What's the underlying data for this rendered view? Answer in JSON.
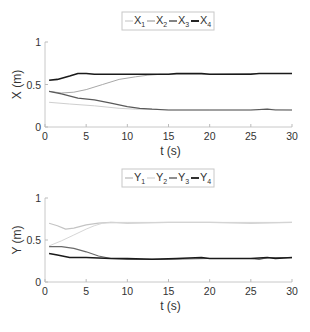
{
  "chart_data": [
    {
      "type": "line",
      "title": "",
      "xlabel": "t (s)",
      "ylabel": "X (m)",
      "xlim": [
        0,
        30
      ],
      "ylim": [
        0,
        1
      ],
      "xticks": [
        0,
        5,
        10,
        15,
        20,
        25,
        30
      ],
      "yticks": [
        0,
        0.5,
        1
      ],
      "xtick_labels": [
        "0",
        "5",
        "10",
        "15",
        "20",
        "25",
        "30"
      ],
      "ytick_labels": [
        "0",
        "0.5",
        "1"
      ],
      "grid": false,
      "legend_position": "top-center-outside",
      "legend": [
        {
          "base": "X",
          "sub": "1"
        },
        {
          "base": "X",
          "sub": "2"
        },
        {
          "base": "X",
          "sub": "3"
        },
        {
          "base": "X",
          "sub": "4"
        }
      ],
      "series": [
        {
          "name": "X1",
          "color": "#cfcfcf",
          "width": 1,
          "x": [
            0.5,
            3,
            6,
            9,
            11,
            13,
            15,
            20,
            25,
            27,
            30
          ],
          "y": [
            0.29,
            0.27,
            0.25,
            0.22,
            0.21,
            0.21,
            0.2,
            0.2,
            0.2,
            0.21,
            0.2
          ]
        },
        {
          "name": "X2",
          "color": "#a8a8a8",
          "width": 1,
          "x": [
            0.5,
            2,
            3.5,
            5,
            7,
            9,
            11,
            12.5,
            14,
            20,
            25,
            30
          ],
          "y": [
            0.42,
            0.4,
            0.41,
            0.44,
            0.5,
            0.56,
            0.59,
            0.61,
            0.62,
            0.62,
            0.63,
            0.63
          ]
        },
        {
          "name": "X3",
          "color": "#5a5a5a",
          "width": 1.2,
          "x": [
            0.5,
            2,
            4,
            6,
            8,
            10,
            11.5,
            13,
            15,
            20,
            25,
            27,
            28,
            30
          ],
          "y": [
            0.42,
            0.39,
            0.34,
            0.32,
            0.28,
            0.24,
            0.22,
            0.21,
            0.2,
            0.2,
            0.2,
            0.21,
            0.2,
            0.2
          ]
        },
        {
          "name": "X4",
          "color": "#1a1a1a",
          "width": 1.6,
          "x": [
            0.5,
            1.5,
            3,
            4,
            5,
            6,
            10,
            15,
            16,
            19,
            20,
            25,
            26,
            30
          ],
          "y": [
            0.55,
            0.56,
            0.6,
            0.63,
            0.63,
            0.62,
            0.62,
            0.62,
            0.63,
            0.63,
            0.62,
            0.62,
            0.63,
            0.63
          ]
        }
      ]
    },
    {
      "type": "line",
      "title": "",
      "xlabel": "t (s)",
      "ylabel": "Y (m)",
      "xlim": [
        0,
        30
      ],
      "ylim": [
        0,
        1
      ],
      "xticks": [
        0,
        5,
        10,
        15,
        20,
        25,
        30
      ],
      "yticks": [
        0,
        0.5,
        1
      ],
      "xtick_labels": [
        "0",
        "5",
        "10",
        "15",
        "20",
        "25",
        "30"
      ],
      "ytick_labels": [
        "0",
        "0.5",
        "1"
      ],
      "grid": false,
      "legend_position": "top-center-outside",
      "legend": [
        {
          "base": "Y",
          "sub": "1"
        },
        {
          "base": "Y",
          "sub": "2"
        },
        {
          "base": "Y",
          "sub": "3"
        },
        {
          "base": "Y",
          "sub": "4"
        }
      ],
      "series": [
        {
          "name": "Y1",
          "color": "#c4c4c4",
          "width": 1.2,
          "x": [
            0.5,
            1.5,
            2.5,
            3.5,
            5,
            6.5,
            8,
            10,
            15,
            20,
            25,
            30
          ],
          "y": [
            0.7,
            0.67,
            0.63,
            0.64,
            0.68,
            0.7,
            0.71,
            0.7,
            0.71,
            0.71,
            0.7,
            0.71
          ]
        },
        {
          "name": "Y2",
          "color": "#d6d6d6",
          "width": 1,
          "x": [
            0.5,
            2,
            3.5,
            5,
            6,
            7,
            8,
            10,
            30
          ],
          "y": [
            0.43,
            0.49,
            0.56,
            0.63,
            0.67,
            0.7,
            0.71,
            0.71,
            0.71
          ]
        },
        {
          "name": "Y3",
          "color": "#6a6a6a",
          "width": 1.2,
          "x": [
            0.5,
            2,
            3.5,
            5,
            6.5,
            8,
            10,
            12,
            14,
            20,
            25,
            26,
            27,
            30
          ],
          "y": [
            0.42,
            0.42,
            0.4,
            0.36,
            0.31,
            0.28,
            0.27,
            0.27,
            0.27,
            0.28,
            0.28,
            0.27,
            0.29,
            0.29
          ]
        },
        {
          "name": "Y4",
          "color": "#1a1a1a",
          "width": 1.5,
          "x": [
            0.5,
            1.5,
            3,
            5,
            8,
            10,
            13,
            16,
            19,
            20,
            25,
            27,
            28,
            30
          ],
          "y": [
            0.34,
            0.32,
            0.29,
            0.29,
            0.28,
            0.28,
            0.27,
            0.28,
            0.29,
            0.28,
            0.28,
            0.29,
            0.28,
            0.29
          ]
        }
      ]
    }
  ]
}
